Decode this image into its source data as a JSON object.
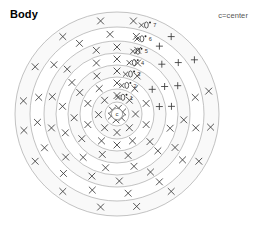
{
  "header": {
    "title": "Body",
    "legend_note": "c=center"
  },
  "chart_data": {
    "type": "scatter",
    "title": "Body",
    "subtitle": "",
    "xlabel": "",
    "ylabel": "",
    "annotations": [
      "c=center"
    ],
    "center_label": "c",
    "ring_labels": [
      "1",
      "2",
      "3",
      "4",
      "5",
      "6",
      "7"
    ],
    "ring_count": 8,
    "legend": [
      {
        "symbol": "x",
        "label": "x-marker"
      },
      {
        "symbol": "+",
        "label": "plus-marker"
      }
    ],
    "grid": true,
    "legend_position": "top-right",
    "center_px": [
      117,
      114
    ],
    "outer_radius_px": 102,
    "ring_radii_px": [
      12,
      25,
      37,
      49,
      61,
      73,
      87,
      102
    ],
    "points": [
      {
        "ring": 0,
        "angle": 20,
        "symbol": "x"
      },
      {
        "ring": 0,
        "angle": 75,
        "symbol": "x"
      },
      {
        "ring": 0,
        "angle": 140,
        "symbol": "x"
      },
      {
        "ring": 0,
        "angle": 200,
        "symbol": "x"
      },
      {
        "ring": 0,
        "angle": 260,
        "symbol": "x"
      },
      {
        "ring": 0,
        "angle": 320,
        "symbol": "x"
      },
      {
        "ring": 1,
        "angle": 90,
        "symbol": "x"
      },
      {
        "ring": 1,
        "angle": 48,
        "symbol": "x"
      },
      {
        "ring": 1,
        "angle": 132,
        "symbol": "x"
      },
      {
        "ring": 1,
        "angle": 182,
        "symbol": "x"
      },
      {
        "ring": 1,
        "angle": 228,
        "symbol": "x"
      },
      {
        "ring": 1,
        "angle": 270,
        "symbol": "x"
      },
      {
        "ring": 1,
        "angle": 312,
        "symbol": "x"
      },
      {
        "ring": 1,
        "angle": 0,
        "symbol": "x"
      },
      {
        "ring": 2,
        "angle": 90,
        "symbol": "x"
      },
      {
        "ring": 2,
        "angle": 55,
        "symbol": "x"
      },
      {
        "ring": 2,
        "angle": 125,
        "symbol": "x"
      },
      {
        "ring": 2,
        "angle": 160,
        "symbol": "x"
      },
      {
        "ring": 2,
        "angle": 200,
        "symbol": "x"
      },
      {
        "ring": 2,
        "angle": 240,
        "symbol": "x"
      },
      {
        "ring": 2,
        "angle": 270,
        "symbol": "x"
      },
      {
        "ring": 2,
        "angle": 300,
        "symbol": "x"
      },
      {
        "ring": 2,
        "angle": 340,
        "symbol": "x"
      },
      {
        "ring": 2,
        "angle": 20,
        "symbol": "x"
      },
      {
        "ring": 3,
        "angle": 90,
        "symbol": "x"
      },
      {
        "ring": 3,
        "angle": 62,
        "symbol": "x"
      },
      {
        "ring": 3,
        "angle": 118,
        "symbol": "x"
      },
      {
        "ring": 3,
        "angle": 150,
        "symbol": "x"
      },
      {
        "ring": 3,
        "angle": 185,
        "symbol": "x"
      },
      {
        "ring": 3,
        "angle": 215,
        "symbol": "x"
      },
      {
        "ring": 3,
        "angle": 250,
        "symbol": "x"
      },
      {
        "ring": 3,
        "angle": 285,
        "symbol": "x"
      },
      {
        "ring": 3,
        "angle": 320,
        "symbol": "x"
      },
      {
        "ring": 3,
        "angle": 35,
        "symbol": "plus"
      },
      {
        "ring": 3,
        "angle": 10,
        "symbol": "plus"
      },
      {
        "ring": 4,
        "angle": 90,
        "symbol": "x"
      },
      {
        "ring": 4,
        "angle": 68,
        "symbol": "x"
      },
      {
        "ring": 4,
        "angle": 112,
        "symbol": "x"
      },
      {
        "ring": 4,
        "angle": 145,
        "symbol": "x"
      },
      {
        "ring": 4,
        "angle": 172,
        "symbol": "x"
      },
      {
        "ring": 4,
        "angle": 200,
        "symbol": "x"
      },
      {
        "ring": 4,
        "angle": 232,
        "symbol": "x"
      },
      {
        "ring": 4,
        "angle": 258,
        "symbol": "x"
      },
      {
        "ring": 4,
        "angle": 288,
        "symbol": "x"
      },
      {
        "ring": 4,
        "angle": 318,
        "symbol": "x"
      },
      {
        "ring": 4,
        "angle": 345,
        "symbol": "x"
      },
      {
        "ring": 4,
        "angle": 30,
        "symbol": "plus"
      },
      {
        "ring": 4,
        "angle": 8,
        "symbol": "plus"
      },
      {
        "ring": 5,
        "angle": 90,
        "symbol": "x"
      },
      {
        "ring": 5,
        "angle": 72,
        "symbol": "x"
      },
      {
        "ring": 5,
        "angle": 108,
        "symbol": "x"
      },
      {
        "ring": 5,
        "angle": 138,
        "symbol": "x"
      },
      {
        "ring": 5,
        "angle": 165,
        "symbol": "x"
      },
      {
        "ring": 5,
        "angle": 192,
        "symbol": "x"
      },
      {
        "ring": 5,
        "angle": 220,
        "symbol": "x"
      },
      {
        "ring": 5,
        "angle": 248,
        "symbol": "x"
      },
      {
        "ring": 5,
        "angle": 272,
        "symbol": "x"
      },
      {
        "ring": 5,
        "angle": 300,
        "symbol": "x"
      },
      {
        "ring": 5,
        "angle": 330,
        "symbol": "x"
      },
      {
        "ring": 5,
        "angle": 355,
        "symbol": "x"
      },
      {
        "ring": 5,
        "angle": 25,
        "symbol": "plus"
      },
      {
        "ring": 5,
        "angle": 48,
        "symbol": "plus"
      },
      {
        "ring": 6,
        "angle": 95,
        "symbol": "x"
      },
      {
        "ring": 6,
        "angle": 76,
        "symbol": "x"
      },
      {
        "ring": 6,
        "angle": 118,
        "symbol": "x"
      },
      {
        "ring": 6,
        "angle": 142,
        "symbol": "x"
      },
      {
        "ring": 6,
        "angle": 168,
        "symbol": "x"
      },
      {
        "ring": 6,
        "angle": 186,
        "symbol": "x"
      },
      {
        "ring": 6,
        "angle": 205,
        "symbol": "x"
      },
      {
        "ring": 6,
        "angle": 228,
        "symbol": "x"
      },
      {
        "ring": 6,
        "angle": 252,
        "symbol": "x"
      },
      {
        "ring": 6,
        "angle": 278,
        "symbol": "x"
      },
      {
        "ring": 6,
        "angle": 302,
        "symbol": "x"
      },
      {
        "ring": 6,
        "angle": 325,
        "symbol": "x"
      },
      {
        "ring": 6,
        "angle": 350,
        "symbol": "x"
      },
      {
        "ring": 6,
        "angle": 12,
        "symbol": "x"
      },
      {
        "ring": 6,
        "angle": 40,
        "symbol": "plus"
      },
      {
        "ring": 6,
        "angle": 58,
        "symbol": "plus"
      },
      {
        "ring": 7,
        "angle": 100,
        "symbol": "x"
      },
      {
        "ring": 7,
        "angle": 80,
        "symbol": "x"
      },
      {
        "ring": 7,
        "angle": 125,
        "symbol": "x"
      },
      {
        "ring": 7,
        "angle": 150,
        "symbol": "x"
      },
      {
        "ring": 7,
        "angle": 172,
        "symbol": "x"
      },
      {
        "ring": 7,
        "angle": 190,
        "symbol": "x"
      },
      {
        "ring": 7,
        "angle": 210,
        "symbol": "x"
      },
      {
        "ring": 7,
        "angle": 235,
        "symbol": "x"
      },
      {
        "ring": 7,
        "angle": 260,
        "symbol": "x"
      },
      {
        "ring": 7,
        "angle": 282,
        "symbol": "x"
      },
      {
        "ring": 7,
        "angle": 305,
        "symbol": "x"
      },
      {
        "ring": 7,
        "angle": 330,
        "symbol": "x"
      },
      {
        "ring": 7,
        "angle": 352,
        "symbol": "x"
      },
      {
        "ring": 7,
        "angle": 14,
        "symbol": "x"
      },
      {
        "ring": 7,
        "angle": 35,
        "symbol": "plus"
      },
      {
        "ring": 7,
        "angle": 55,
        "symbol": "plus"
      }
    ]
  }
}
